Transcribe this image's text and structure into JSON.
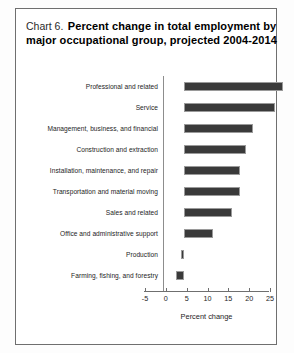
{
  "title": {
    "chart_number": "Chart 6.",
    "line1": "Percent change in total employment by",
    "line2": "major occupational group, projected 2004-2014"
  },
  "colors": {
    "bar_fill": "#3a3a3a",
    "bar_border": "#9a9a9a",
    "axis": "#6f6f6f",
    "frame": "#6f6f6f",
    "text": "#1c1c1c"
  },
  "chart_data": {
    "type": "bar",
    "orientation": "horizontal",
    "title": "Chart 6.  Percent change in total employment by major occupational group, projected 2004-2014",
    "xlabel": "Percent change",
    "ylabel": "",
    "xlim": [
      -5,
      25
    ],
    "grid": false,
    "legend": null,
    "categories": [
      "Professional and related",
      "Service",
      "Management, business, and financial",
      "Construction and extraction",
      "Installation, maintenance, and repair",
      "Transportation and material moving",
      "Sales and related",
      "Office and administrative support",
      "Production",
      "Farming, fishing, and forestry"
    ],
    "values": [
      23.8,
      22.0,
      16.5,
      15.0,
      13.5,
      13.5,
      11.5,
      7.0,
      -0.8,
      -2.0
    ],
    "xticks": [
      -5,
      0,
      5,
      10,
      15,
      20,
      25
    ],
    "xticklabels": [
      "-5",
      "0",
      "5",
      "10",
      "15",
      "20",
      "25"
    ]
  },
  "axis": {
    "x_title": "Percent change"
  }
}
